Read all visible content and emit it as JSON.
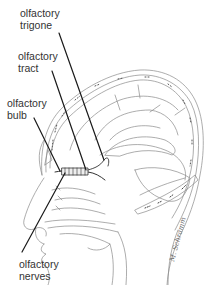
{
  "figure": {
    "labels": [
      {
        "id": "trigone",
        "line1": "olfactory",
        "line2": "trigone"
      },
      {
        "id": "tract",
        "line1": "olfactory",
        "line2": "tract"
      },
      {
        "id": "bulb",
        "line1": "olfactory",
        "line2": "bulb"
      },
      {
        "id": "nerves",
        "line1": "olfactory",
        "line2": "nerves"
      }
    ],
    "signature": "M. Schramm",
    "colors": {
      "line": "#1a1a1a",
      "sketch": "#7a7a7a",
      "text": "#333333",
      "background": "#ffffff"
    }
  }
}
